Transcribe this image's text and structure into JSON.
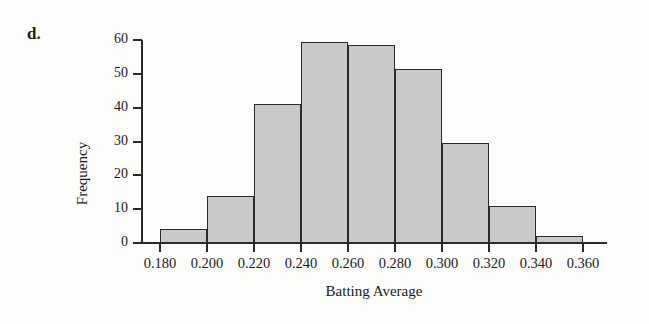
{
  "figure": {
    "panel_label": "d.",
    "background_color": "#fdfdfb",
    "bar_fill_color": "#c9c9c9",
    "bar_edge_color": "#2a2a2a"
  },
  "chart_data": {
    "type": "bar",
    "title": "",
    "subtitle": "",
    "xlabel": "Batting Average",
    "ylabel": "Frequency",
    "xlim": [
      0.18,
      0.36
    ],
    "ylim": [
      0,
      60
    ],
    "grid": false,
    "legend": null,
    "bin_width": 0.02,
    "bin_edges": [
      0.18,
      0.2,
      0.22,
      0.24,
      0.26,
      0.28,
      0.3,
      0.32,
      0.34,
      0.36
    ],
    "categories": [
      "0.180-0.200",
      "0.200-0.220",
      "0.220-0.240",
      "0.240-0.260",
      "0.260-0.280",
      "0.280-0.300",
      "0.300-0.320",
      "0.320-0.340",
      "0.340-0.360"
    ],
    "values": [
      4,
      14,
      41,
      59.5,
      58.5,
      51.5,
      29.5,
      11,
      2
    ],
    "xtick_labels": [
      "0.180",
      "0.200",
      "0.220",
      "0.240",
      "0.260",
      "0.280",
      "0.300",
      "0.320",
      "0.340",
      "0.360"
    ],
    "xtick_values": [
      0.18,
      0.2,
      0.22,
      0.24,
      0.26,
      0.28,
      0.3,
      0.32,
      0.34,
      0.36
    ],
    "ytick_labels": [
      "0",
      "10",
      "20",
      "30",
      "40",
      "50",
      "60"
    ],
    "ytick_values": [
      0,
      10,
      20,
      30,
      40,
      50,
      60
    ],
    "annotations": []
  }
}
